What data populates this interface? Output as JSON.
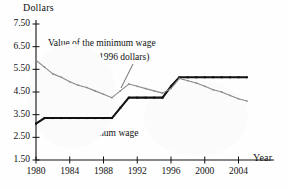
{
  "chart_data": {
    "type": "line",
    "title": "",
    "xlabel": "Year",
    "ylabel": "Dollars",
    "xlim": [
      1980,
      2005.6
    ],
    "ylim": [
      1.5,
      7.5
    ],
    "grid": false,
    "legend_position": "inline-annotations",
    "yticks": [
      "7.50",
      "6.50",
      "5.50",
      "4.50",
      "3.50",
      "2.50",
      "1.50"
    ],
    "ytick_values": [
      7.5,
      6.5,
      5.5,
      4.5,
      3.5,
      2.5,
      1.5
    ],
    "xticks": [
      "1980",
      "1984",
      "1988",
      "1992",
      "1996",
      "2000",
      "2004"
    ],
    "xtick_values": [
      1980,
      1984,
      1988,
      1992,
      1996,
      2000,
      2004
    ],
    "x": [
      1980,
      1981,
      1982,
      1983,
      1984,
      1985,
      1986,
      1987,
      1988,
      1989,
      1990,
      1991,
      1992,
      1993,
      1994,
      1995,
      1996,
      1997,
      1998,
      1999,
      2000,
      2001,
      2002,
      2003,
      2004,
      2005
    ],
    "series": [
      {
        "name": "Minimum wage",
        "color": "#111111",
        "style": "thick-black-with-square-markers",
        "values": [
          3.1,
          3.35,
          3.35,
          3.35,
          3.35,
          3.35,
          3.35,
          3.35,
          3.35,
          3.35,
          3.8,
          4.25,
          4.25,
          4.25,
          4.25,
          4.25,
          4.75,
          5.15,
          5.15,
          5.15,
          5.15,
          5.15,
          5.15,
          5.15,
          5.15,
          5.15
        ]
      },
      {
        "name": "Value of the minimum wage (in constant 1996 dollars)",
        "color": "#8a8a8a",
        "style": "thin-gray-with-small-markers",
        "values": [
          5.9,
          5.6,
          5.3,
          5.15,
          4.95,
          4.8,
          4.7,
          4.55,
          4.4,
          4.25,
          4.55,
          4.85,
          4.75,
          4.65,
          4.55,
          4.45,
          4.65,
          5.1,
          5.0,
          4.9,
          4.75,
          4.6,
          4.5,
          4.35,
          4.2,
          4.1
        ]
      }
    ],
    "annotations": [
      {
        "id": "real-line-1",
        "text": "Value of the minimum wage"
      },
      {
        "id": "real-line-2",
        "text": "(in constant 1996 dollars)"
      },
      {
        "id": "nominal-line",
        "text": "Minimum wage"
      }
    ]
  }
}
